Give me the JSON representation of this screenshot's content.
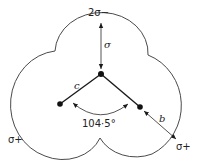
{
  "diagram": {
    "labels": {
      "top_charge": "2σ−",
      "oxygen_lone_distance": "σ",
      "bond_label_c": "c",
      "bond_label_b": "b",
      "angle": "104·5°",
      "left_charge": "σ+",
      "right_charge": "σ+"
    },
    "atoms": [
      {
        "name": "oxygen",
        "role": "central"
      },
      {
        "name": "hydrogen-left",
        "role": "terminal"
      },
      {
        "name": "hydrogen-right",
        "role": "terminal"
      }
    ],
    "bond_angle_degrees": 104.5
  }
}
